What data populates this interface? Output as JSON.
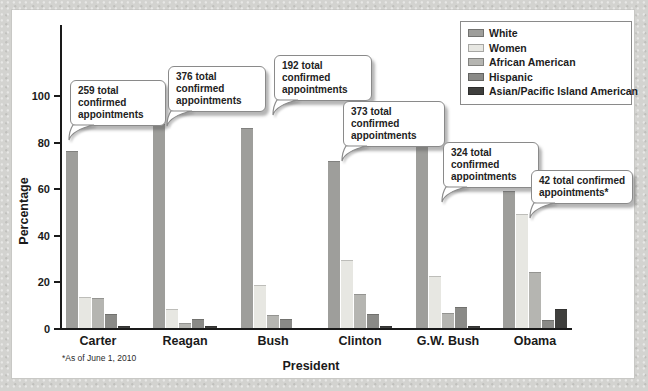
{
  "figure": {
    "ylabel": "Percentage",
    "xlabel": "President",
    "footnote": "*As of June 1, 2010"
  },
  "chart_data": {
    "type": "bar",
    "title": "",
    "xlabel": "President",
    "ylabel": "Percentage",
    "ylim": [
      0,
      100
    ],
    "yticks": [
      0,
      20,
      40,
      60,
      80,
      100
    ],
    "grid": false,
    "legend_position": "top-right",
    "categories": [
      "Carter",
      "Reagan",
      "Bush",
      "Clinton",
      "G.W. Bush",
      "Obama"
    ],
    "series": [
      {
        "name": "White",
        "color": "#9e9e9b",
        "values": [
          76,
          87.5,
          86,
          71.5,
          80.5,
          59
        ]
      },
      {
        "name": "Women",
        "color": "#e7e7e2",
        "values": [
          13.5,
          8,
          18.5,
          29,
          22.5,
          49
        ]
      },
      {
        "name": "African American",
        "color": "#b5b5b1",
        "values": [
          13,
          2,
          5.5,
          14.5,
          6.5,
          24
        ]
      },
      {
        "name": "Hispanic",
        "color": "#8a8a87",
        "values": [
          6,
          4,
          4,
          6,
          9,
          3.5
        ]
      },
      {
        "name": "Asian/Pacific Island American",
        "color": "#3f3f3d",
        "values": [
          1,
          0.7,
          0,
          1,
          1,
          8
        ]
      }
    ],
    "annotations": [
      {
        "category": "Carter",
        "text": "259 total confirmed appointments"
      },
      {
        "category": "Reagan",
        "text": "376 total confirmed appointments"
      },
      {
        "category": "Bush",
        "text": "192 total confirmed appointments"
      },
      {
        "category": "Clinton",
        "text": "373 total confirmed appointments"
      },
      {
        "category": "G.W. Bush",
        "text": "324 total confirmed appointments"
      },
      {
        "category": "Obama",
        "text": "42 total confirmed appointments*"
      }
    ]
  }
}
